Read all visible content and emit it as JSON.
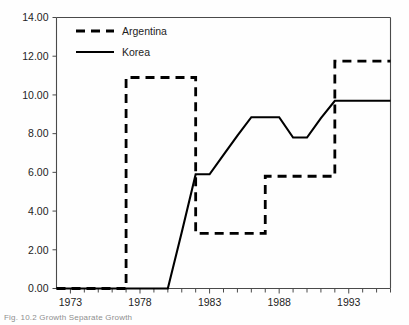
{
  "chart_data": {
    "type": "line",
    "title": "",
    "xlabel": "",
    "ylabel": "",
    "xlim": [
      1972,
      1996
    ],
    "ylim": [
      0.0,
      14.0
    ],
    "grid": false,
    "legend_position": "top-left",
    "y_ticks": [
      "0.00",
      "2.00",
      "4.00",
      "6.00",
      "8.00",
      "10.00",
      "12.00",
      "14.00"
    ],
    "y_tick_values": [
      0.0,
      2.0,
      4.0,
      6.0,
      8.0,
      10.0,
      12.0,
      14.0
    ],
    "x_ticks": [
      "1973",
      "1978",
      "1983",
      "1988",
      "1993"
    ],
    "x_tick_values": [
      1973,
      1978,
      1983,
      1988,
      1993
    ],
    "x_minor_tick_interval": 1,
    "x": [
      1972,
      1973,
      1974,
      1975,
      1976,
      1977,
      1978,
      1979,
      1980,
      1981,
      1982,
      1983,
      1984,
      1985,
      1986,
      1987,
      1988,
      1989,
      1990,
      1991,
      1992,
      1993,
      1994,
      1995,
      1996
    ],
    "series": [
      {
        "name": "Argentina",
        "style": "dashed",
        "color": "#000000",
        "values": [
          0.0,
          0.0,
          0.0,
          0.0,
          0.0,
          10.9,
          10.9,
          10.9,
          10.9,
          10.9,
          2.85,
          2.85,
          2.85,
          2.85,
          2.85,
          5.8,
          5.8,
          5.8,
          5.8,
          5.8,
          11.75,
          11.75,
          11.75,
          11.75,
          11.75
        ]
      },
      {
        "name": "Korea",
        "style": "solid",
        "color": "#000000",
        "values": [
          0.0,
          0.0,
          0.0,
          0.0,
          0.0,
          0.0,
          0.0,
          0.0,
          0.0,
          2.9,
          5.9,
          5.9,
          6.9,
          7.9,
          8.85,
          8.85,
          8.85,
          7.8,
          7.8,
          8.8,
          9.7,
          9.7,
          9.7,
          9.7,
          9.7
        ]
      }
    ]
  },
  "legend": {
    "entries": [
      {
        "label": "Argentina",
        "style": "dashed"
      },
      {
        "label": "Korea",
        "style": "solid"
      }
    ]
  },
  "caption": {
    "text": "Fig. 10.2  Growth  Separate  Growth"
  }
}
